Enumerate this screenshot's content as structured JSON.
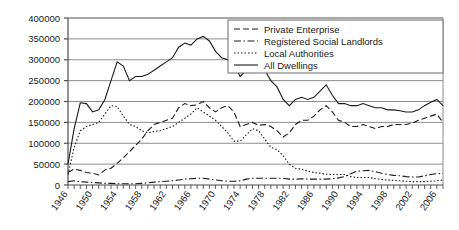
{
  "chart_data": {
    "type": "line",
    "title": "",
    "subtitle": "",
    "xlabel": "",
    "ylabel": "",
    "grid": true,
    "legend_position": "top-right",
    "ylim": [
      0,
      400000
    ],
    "ytick_step": 50000,
    "yticks": [
      "0",
      "50000",
      "100000",
      "150000",
      "200000",
      "250000",
      "300000",
      "350000",
      "400000"
    ],
    "ytick_values": [
      0,
      50000,
      100000,
      150000,
      200000,
      250000,
      300000,
      350000,
      400000
    ],
    "xlim": [
      1946,
      2007
    ],
    "xtick_step": 4,
    "xticks": [
      "1946",
      "1950",
      "1954",
      "1958",
      "1962",
      "1966",
      "1970",
      "1974",
      "1978",
      "1982",
      "1986",
      "1990",
      "1994",
      "1998",
      "2002",
      "2006"
    ],
    "xtick_values": [
      1946,
      1950,
      1954,
      1958,
      1962,
      1966,
      1970,
      1974,
      1978,
      1982,
      1986,
      1990,
      1994,
      1998,
      2002,
      2006
    ],
    "x": [
      1946,
      1947,
      1948,
      1949,
      1950,
      1951,
      1952,
      1953,
      1954,
      1955,
      1956,
      1957,
      1958,
      1959,
      1960,
      1961,
      1962,
      1963,
      1964,
      1965,
      1966,
      1967,
      1968,
      1969,
      1970,
      1971,
      1972,
      1973,
      1974,
      1975,
      1976,
      1977,
      1978,
      1979,
      1980,
      1981,
      1982,
      1983,
      1984,
      1985,
      1986,
      1987,
      1988,
      1989,
      1990,
      1991,
      1992,
      1993,
      1994,
      1995,
      1996,
      1997,
      1998,
      1999,
      2000,
      2001,
      2002,
      2003,
      2004,
      2005,
      2006,
      2007
    ],
    "series": [
      {
        "name": "Private Enterprise",
        "style": "dashed",
        "values": [
          30000,
          38000,
          35000,
          30000,
          28000,
          24000,
          36000,
          40000,
          52000,
          65000,
          80000,
          95000,
          110000,
          130000,
          145000,
          150000,
          155000,
          160000,
          185000,
          195000,
          190000,
          192000,
          200000,
          185000,
          175000,
          185000,
          190000,
          175000,
          140000,
          145000,
          150000,
          143000,
          145000,
          140000,
          130000,
          115000,
          125000,
          145000,
          155000,
          155000,
          165000,
          180000,
          190000,
          175000,
          155000,
          150000,
          140000,
          140000,
          145000,
          140000,
          135000,
          140000,
          140000,
          145000,
          145000,
          145000,
          148000,
          155000,
          160000,
          165000,
          170000,
          150000
        ]
      },
      {
        "name": "Registered Social Landlords",
        "style": "dashdot",
        "values": [
          8000,
          10000,
          8000,
          7000,
          6000,
          5000,
          4000,
          4000,
          3000,
          3000,
          3000,
          3000,
          4000,
          5000,
          7000,
          8000,
          9000,
          10000,
          12000,
          14000,
          15000,
          16000,
          16000,
          14000,
          12000,
          10000,
          9000,
          9000,
          10000,
          14000,
          16000,
          16000,
          16000,
          16000,
          16000,
          16000,
          14000,
          14000,
          15000,
          14000,
          14000,
          14000,
          14000,
          15000,
          17000,
          20000,
          27000,
          33000,
          34000,
          35000,
          32000,
          28000,
          25000,
          23000,
          22000,
          20000,
          19000,
          19000,
          22000,
          25000,
          27000,
          28000
        ]
      },
      {
        "name": "Local Authorities",
        "style": "dotted",
        "values": [
          25000,
          90000,
          130000,
          140000,
          145000,
          150000,
          170000,
          190000,
          188000,
          165000,
          145000,
          140000,
          130000,
          125000,
          128000,
          130000,
          135000,
          140000,
          150000,
          160000,
          170000,
          185000,
          175000,
          165000,
          155000,
          140000,
          125000,
          105000,
          105000,
          120000,
          135000,
          130000,
          110000,
          90000,
          85000,
          70000,
          50000,
          40000,
          38000,
          33000,
          30000,
          28000,
          26000,
          25000,
          25000,
          25000,
          20000,
          18000,
          18000,
          18000,
          15000,
          13000,
          12000,
          11000,
          10000,
          9000,
          8000,
          8000,
          8000,
          9000,
          10000,
          12000
        ]
      },
      {
        "name": "All Dwellings",
        "style": "solid",
        "values": [
          50000,
          135000,
          197000,
          195000,
          175000,
          180000,
          205000,
          250000,
          295000,
          285000,
          250000,
          260000,
          260000,
          265000,
          275000,
          285000,
          295000,
          305000,
          330000,
          340000,
          335000,
          350000,
          356000,
          345000,
          320000,
          305000,
          300000,
          290000,
          260000,
          275000,
          300000,
          295000,
          275000,
          250000,
          235000,
          205000,
          190000,
          205000,
          210000,
          205000,
          210000,
          225000,
          240000,
          215000,
          195000,
          195000,
          190000,
          190000,
          195000,
          190000,
          185000,
          185000,
          180000,
          180000,
          178000,
          175000,
          175000,
          180000,
          190000,
          198000,
          205000,
          190000
        ]
      }
    ]
  },
  "legend": {
    "items": [
      {
        "label": "Private Enterprise",
        "style": "dashed"
      },
      {
        "label": "Registered Social Landlords",
        "style": "dashdot"
      },
      {
        "label": "Local Authorities",
        "style": "dotted"
      },
      {
        "label": "All Dwellings",
        "style": "solid"
      }
    ]
  },
  "colors": {
    "ink": "#1a1a1a",
    "grid": "#8c8c8c",
    "axis": "#4d4d4d",
    "background": "#ffffff"
  }
}
